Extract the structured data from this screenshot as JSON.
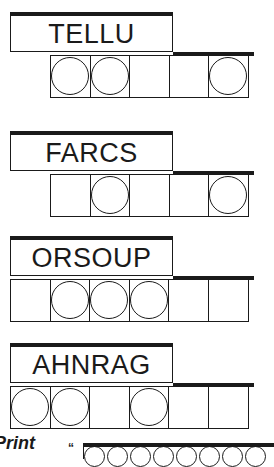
{
  "puzzles": [
    {
      "scrambled": "TELLU",
      "letters": 5,
      "circled": [
        1,
        2,
        5
      ]
    },
    {
      "scrambled": "FARCS",
      "letters": 5,
      "circled": [
        2,
        5
      ]
    },
    {
      "scrambled": "ORSOUP",
      "letters": 6,
      "circled": [
        2,
        3,
        4
      ]
    },
    {
      "scrambled": "AHNRAG",
      "letters": 6,
      "circled": [
        1,
        2,
        4
      ]
    }
  ],
  "footer": {
    "print_label": "Print",
    "quote_mark": "“"
  }
}
